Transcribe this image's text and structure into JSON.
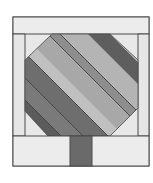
{
  "colors": {
    "background": "#ffffff",
    "frame_light": "#e8e8e8",
    "outline": "#4a4a4a",
    "stripe_darkest": "#5c5c5c",
    "stripe_dark": "#6f6f6f",
    "stripe_medium": "#8c8c8c",
    "stripe_light": "#b4b4b4",
    "stripe_lighter": "#c6c6c6",
    "trunk": "#6a6a6a"
  },
  "pieces": {
    "top_band": "top border strip",
    "bottom_band": "bottom border strip",
    "left_strip": "left side strip",
    "right_strip": "right side strip",
    "canopy": "octagonal striped tree canopy",
    "trunk": "tree trunk"
  }
}
